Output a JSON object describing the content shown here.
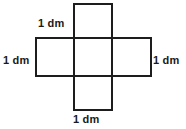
{
  "figure": {
    "kind": "cross-net-of-cube",
    "stroke_color": "#1d1d1d",
    "background_color": "#ffffff",
    "stroke_width": 2,
    "unit_cell_px": 38,
    "squares": [
      {
        "name": "top-square",
        "x": 74,
        "y": 4,
        "w": 38,
        "h": 34
      },
      {
        "name": "left-square",
        "x": 36,
        "y": 38,
        "w": 38,
        "h": 38
      },
      {
        "name": "center-square",
        "x": 74,
        "y": 38,
        "w": 38,
        "h": 38
      },
      {
        "name": "right-square",
        "x": 112,
        "y": 38,
        "w": 40,
        "h": 38
      },
      {
        "name": "bottom-square",
        "x": 74,
        "y": 76,
        "w": 38,
        "h": 35
      }
    ],
    "labels": {
      "top": "1 dm",
      "left": "1 dm",
      "right": "1 dm",
      "bottom": "1 dm"
    }
  }
}
